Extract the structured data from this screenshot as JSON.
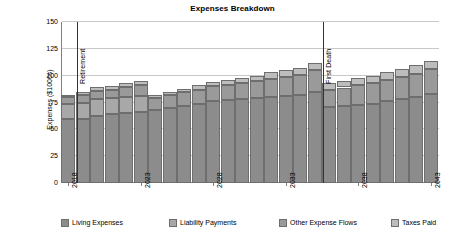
{
  "chart_data": {
    "type": "bar",
    "stacked": true,
    "title": "Expenses Breakdown",
    "xlabel": "",
    "ylabel": "Expenses ($1000s)",
    "ylim": [
      0,
      150
    ],
    "ytick_labels": [
      "0",
      "25",
      "50",
      "75",
      "100",
      "125",
      "150"
    ],
    "ytick_values": [
      0,
      25,
      50,
      75,
      100,
      125,
      150
    ],
    "grid": true,
    "legend_position": "bottom",
    "x": [
      2018,
      2019,
      2020,
      2021,
      2022,
      2023,
      2024,
      2025,
      2026,
      2027,
      2028,
      2029,
      2030,
      2031,
      2032,
      2033,
      2034,
      2035,
      2036,
      2037,
      2038,
      2039,
      2040,
      2041,
      2042,
      2043
    ],
    "xtick_labels": [
      "2018",
      "2023",
      "2028",
      "2033",
      "2038",
      "2043"
    ],
    "xtick_values": [
      2018,
      2023,
      2028,
      2033,
      2038,
      2043
    ],
    "categories": [
      "2018",
      "2019",
      "2020",
      "2021",
      "2022",
      "2023",
      "2024",
      "2025",
      "2026",
      "2027",
      "2028",
      "2029",
      "2030",
      "2031",
      "2032",
      "2033",
      "2034",
      "2035",
      "2036",
      "2037",
      "2038",
      "2039",
      "2040",
      "2041",
      "2042",
      "2043"
    ],
    "series": [
      {
        "name": "Living Expenses",
        "color": "#8c8c8c",
        "values": [
          60,
          60,
          62,
          64,
          65,
          66,
          68,
          70,
          72,
          74,
          76,
          77,
          78,
          79,
          80,
          81,
          82,
          85,
          71,
          72,
          73,
          74,
          76,
          78,
          80,
          83
        ]
      },
      {
        "name": "Liability Payments",
        "color": "#a8a8a8",
        "values": [
          14,
          15,
          16,
          15,
          15,
          15,
          0,
          0,
          0,
          0,
          0,
          0,
          0,
          0,
          0,
          0,
          0,
          0,
          0,
          0,
          0,
          0,
          0,
          0,
          0,
          0
        ]
      },
      {
        "name": "Other Expense Flows",
        "color": "#9a9a9a",
        "values": [
          6,
          7,
          8,
          8,
          9,
          10,
          11,
          12,
          13,
          13,
          14,
          14,
          15,
          16,
          17,
          18,
          19,
          20,
          16,
          17,
          18,
          19,
          20,
          21,
          22,
          23
        ]
      },
      {
        "name": "Taxes Paid",
        "color": "#bdbdbd",
        "values": [
          2,
          3,
          3,
          3,
          4,
          4,
          3,
          3,
          3,
          4,
          4,
          5,
          5,
          5,
          6,
          6,
          6,
          7,
          6,
          6,
          7,
          7,
          7,
          7,
          8,
          8
        ]
      }
    ],
    "totals": [
      82,
      85,
      89,
      90,
      93,
      95,
      82,
      85,
      88,
      91,
      94,
      96,
      98,
      100,
      103,
      105,
      107,
      112,
      93,
      95,
      98,
      100,
      103,
      106,
      110,
      114
    ],
    "annotations": [
      {
        "label": "Retirement",
        "x": 2018.6
      },
      {
        "label": "First Death",
        "x": 2035.6
      }
    ]
  },
  "legend": {
    "items": [
      {
        "label": "Living Expenses"
      },
      {
        "label": "Liability Payments"
      },
      {
        "label": "Other Expense Flows"
      },
      {
        "label": "Taxes Paid"
      }
    ]
  }
}
